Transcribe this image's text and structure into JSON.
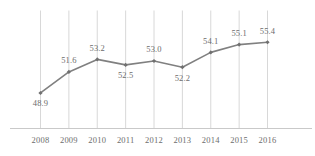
{
  "chart_data": {
    "type": "line",
    "title": "",
    "subtitle": "",
    "xlabel": "",
    "ylabel": "",
    "categories": [
      "2008",
      "2009",
      "2010",
      "2011",
      "2012",
      "2013",
      "2014",
      "2015",
      "2016"
    ],
    "values": [
      48.9,
      51.6,
      53.2,
      52.5,
      53.0,
      52.2,
      54.1,
      55.1,
      55.4
    ],
    "data_labels": [
      "48.9",
      "51.6",
      "53.2",
      "52.5",
      "53.0",
      "52.2",
      "54.1",
      "55.1",
      "55.4"
    ],
    "label_positions": [
      "below",
      "above",
      "above",
      "below",
      "above",
      "below",
      "above",
      "above",
      "above"
    ],
    "ylim": [
      48.0,
      56.2
    ],
    "grid": {
      "vertical": true,
      "horizontal": false
    },
    "legend": {
      "visible": false,
      "position": "none",
      "entries": []
    },
    "series": [
      {
        "name": "",
        "values": [
          48.9,
          51.6,
          53.2,
          52.5,
          53.0,
          52.2,
          54.1,
          55.1,
          55.4
        ]
      }
    ]
  },
  "style": {
    "line_color": "#808080",
    "marker_color": "#707070",
    "grid_color": "#d4d4d4",
    "axis_color": "#c9c9c9",
    "text_color": "#6d6d6d",
    "background": "#ffffff"
  },
  "axis": {
    "x_tick_labels": [
      "2008",
      "2009",
      "2010",
      "2011",
      "2012",
      "2013",
      "2014",
      "2015",
      "2016"
    ]
  }
}
